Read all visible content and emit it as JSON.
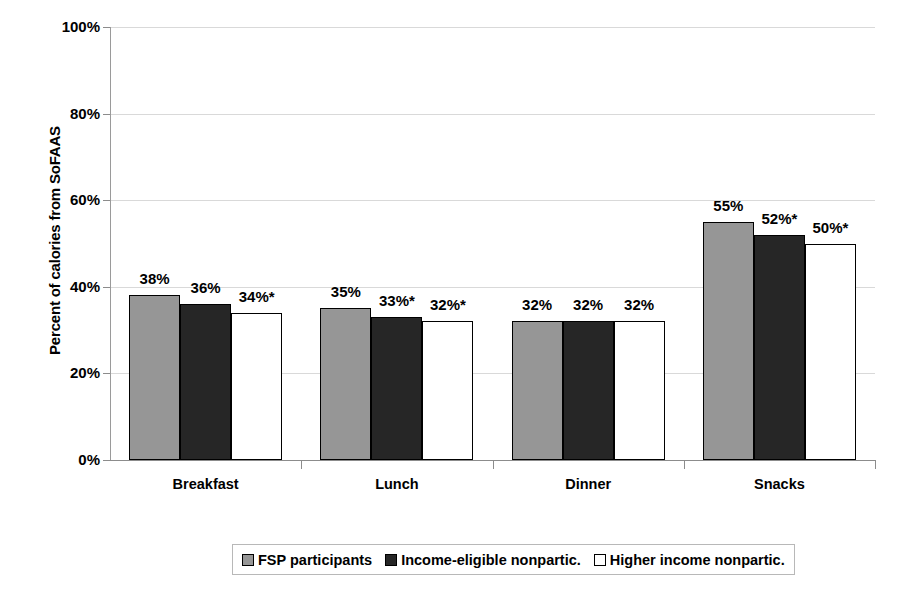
{
  "chart_data": {
    "type": "bar",
    "title": "",
    "xlabel": "",
    "ylabel": "Percent of calories from SoFAAS",
    "ylim": [
      0,
      100
    ],
    "ytick_labels": [
      "100%",
      "80%",
      "60%",
      "40%",
      "20%",
      "0%"
    ],
    "ytick_values": [
      100,
      80,
      60,
      40,
      20,
      0
    ],
    "grid": true,
    "legend_position": "bottom",
    "categories": [
      "Breakfast",
      "Lunch",
      "Dinner",
      "Snacks"
    ],
    "series": [
      {
        "name": "FSP participants",
        "swatch": "series-0",
        "color": "#969696",
        "values": [
          38,
          35,
          32,
          55
        ],
        "labels": [
          "38%",
          "35%",
          "32%",
          "55%"
        ]
      },
      {
        "name": "Income-eligible nonpartic.",
        "swatch": "series-1",
        "color": "#262626",
        "values": [
          36,
          33,
          32,
          52
        ],
        "labels": [
          "36%",
          "33%*",
          "32%",
          "52%*"
        ]
      },
      {
        "name": "Higher income nonpartic.",
        "swatch": "series-2",
        "color": "#ffffff",
        "values": [
          34,
          32,
          32,
          50
        ],
        "labels": [
          "34%*",
          "32%*",
          "32%",
          "50%*"
        ]
      }
    ],
    "annotation_note": "* denotes statistically significant difference"
  },
  "axis": {
    "y_title": "Percent of calories from SoFAAS"
  },
  "legend": {
    "items": [
      {
        "label": "FSP participants",
        "swatch": "series-0"
      },
      {
        "label": "Income-eligible nonpartic.",
        "swatch": "series-1"
      },
      {
        "label": "Higher income nonpartic.",
        "swatch": "series-2"
      }
    ]
  },
  "colors": {
    "series_0": "#969696",
    "series_1": "#262626",
    "series_2": "#ffffff",
    "border": "#000000",
    "gridline": "#d9d9d9",
    "axis": "#8c8c8c"
  }
}
